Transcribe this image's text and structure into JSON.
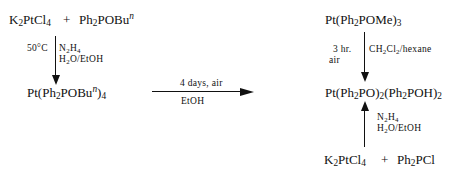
{
  "scheme": {
    "left": {
      "reactant_1": {
        "pre": "K",
        "sub1": "2",
        "mid": "PtCl",
        "sub2": "4"
      },
      "plus": "+",
      "reactant_2": {
        "pre": "Ph",
        "sub1": "2",
        "mid": "POBu",
        "sup": "n"
      },
      "conditions_left": "50°C",
      "conditions_right_1": {
        "pre": "N",
        "sub1": "2",
        "mid": "H",
        "sub2": "4"
      },
      "conditions_right_2": {
        "pre": "H",
        "sub1": "2",
        "mid": "O/EtOH"
      },
      "product": {
        "a": "Pt(Ph",
        "sub1": "2",
        "b": "POBu",
        "sup": "n",
        "c": ")",
        "sub2": "4"
      }
    },
    "middle_arrow": {
      "above": "4   days,   air",
      "below": "EtOH"
    },
    "right": {
      "top_reactant": {
        "a": "Pt(Ph",
        "sub1": "2",
        "b": "POMe)",
        "sub2": "3"
      },
      "top_conditions_left_1": "3   hr.",
      "top_conditions_left_2": "air",
      "top_conditions_right": {
        "a": "CH",
        "sub1": "2",
        "b": "Cl",
        "sub2": "2",
        "c": "/hexane"
      },
      "product": {
        "a": "Pt(Ph",
        "sub1": "2",
        "b": "PO)",
        "sub2": "2",
        "c": "(Ph",
        "sub3": "2",
        "d": "POH)",
        "sub4": "2"
      },
      "bottom_conditions_1": {
        "pre": "N",
        "sub1": "2",
        "mid": "H",
        "sub2": "4"
      },
      "bottom_conditions_2": {
        "pre": "H",
        "sub1": "2",
        "mid": "O/EtOH"
      },
      "bottom_reactant_1": {
        "pre": "K",
        "sub1": "2",
        "mid": "PtCl",
        "sub2": "4"
      },
      "plus": "+",
      "bottom_reactant_2": {
        "pre": "Ph",
        "sub1": "2",
        "mid": "PCl"
      }
    }
  }
}
